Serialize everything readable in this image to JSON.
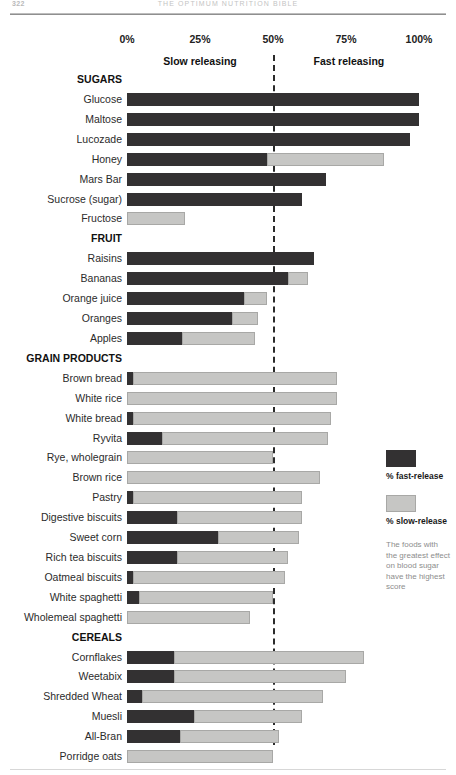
{
  "runhead": {
    "folio": "322",
    "title": "THE OPTIMUM NUTRITION BIBLE"
  },
  "axis": {
    "ticks": [
      "0%",
      "25%",
      "50%",
      "75%",
      "100%"
    ]
  },
  "bands": {
    "slow": "Slow releasing",
    "fast": "Fast releasing"
  },
  "legend": {
    "fast_label": "% fast-release",
    "slow_label": "% slow-release",
    "note": "The foods with the greatest effect on blood sugar have the highest score"
  },
  "colors": {
    "fast_release": "#333132",
    "slow_release": "#c6c6c4",
    "midline": "#2b2b2b",
    "text": "#2b2b2b"
  },
  "chart_data": {
    "type": "bar",
    "orientation": "horizontal",
    "stacked": true,
    "title": "",
    "xlabel": "",
    "ylabel": "",
    "xlim": [
      0,
      100
    ],
    "xticks": [
      0,
      25,
      50,
      75,
      100
    ],
    "grid": false,
    "reference_line": 50,
    "legend_position": "right",
    "series": [
      {
        "name": "% fast-release",
        "color": "#333132"
      },
      {
        "name": "% slow-release",
        "color": "#c6c6c4"
      }
    ],
    "groups": [
      {
        "name": "SUGARS",
        "items": [
          {
            "label": "Glucose",
            "fast": 100,
            "slow": 0,
            "total": 100
          },
          {
            "label": "Maltose",
            "fast": 100,
            "slow": 0,
            "total": 100
          },
          {
            "label": "Lucozade",
            "fast": 97,
            "slow": 0,
            "total": 97
          },
          {
            "label": "Honey",
            "fast": 48,
            "slow": 40,
            "total": 88
          },
          {
            "label": "Mars Bar",
            "fast": 68,
            "slow": 0,
            "total": 68
          },
          {
            "label": "Sucrose (sugar)",
            "fast": 60,
            "slow": 0,
            "total": 60
          },
          {
            "label": "Fructose",
            "fast": 0,
            "slow": 20,
            "total": 20
          }
        ]
      },
      {
        "name": "FRUIT",
        "items": [
          {
            "label": "Raisins",
            "fast": 64,
            "slow": 0,
            "total": 64
          },
          {
            "label": "Bananas",
            "fast": 55,
            "slow": 7,
            "total": 62
          },
          {
            "label": "Orange juice",
            "fast": 40,
            "slow": 8,
            "total": 48
          },
          {
            "label": "Oranges",
            "fast": 36,
            "slow": 9,
            "total": 45
          },
          {
            "label": "Apples",
            "fast": 19,
            "slow": 25,
            "total": 44
          }
        ]
      },
      {
        "name": "GRAIN PRODUCTS",
        "items": [
          {
            "label": "Brown bread",
            "fast": 2,
            "slow": 70,
            "total": 72
          },
          {
            "label": "White rice",
            "fast": 0,
            "slow": 72,
            "total": 72
          },
          {
            "label": "White bread",
            "fast": 2,
            "slow": 68,
            "total": 70
          },
          {
            "label": "Ryvita",
            "fast": 12,
            "slow": 57,
            "total": 69
          },
          {
            "label": "Rye, wholegrain",
            "fast": 0,
            "slow": 50,
            "total": 50
          },
          {
            "label": "Brown rice",
            "fast": 0,
            "slow": 66,
            "total": 66
          },
          {
            "label": "Pastry",
            "fast": 2,
            "slow": 58,
            "total": 60
          },
          {
            "label": "Digestive biscuits",
            "fast": 17,
            "slow": 43,
            "total": 60
          },
          {
            "label": "Sweet corn",
            "fast": 31,
            "slow": 28,
            "total": 59
          },
          {
            "label": "Rich tea biscuits",
            "fast": 17,
            "slow": 38,
            "total": 55
          },
          {
            "label": "Oatmeal biscuits",
            "fast": 2,
            "slow": 52,
            "total": 54
          },
          {
            "label": "White spaghetti",
            "fast": 4,
            "slow": 46,
            "total": 50
          },
          {
            "label": "Wholemeal spaghetti",
            "fast": 0,
            "slow": 42,
            "total": 42
          }
        ]
      },
      {
        "name": "CEREALS",
        "items": [
          {
            "label": "Shredded Wheat",
            "fast": 5,
            "slow": 62,
            "total": 67
          },
          {
            "label": "Cornflakes",
            "fast": 16,
            "slow": 65,
            "total": 81
          },
          {
            "label": "Weetabix",
            "fast": 16,
            "slow": 59,
            "total": 75
          },
          {
            "label": "Muesli",
            "fast": 23,
            "slow": 37,
            "total": 60
          },
          {
            "label": "All-Bran",
            "fast": 18,
            "slow": 34,
            "total": 52
          },
          {
            "label": "Porridge oats",
            "fast": 0,
            "slow": 50,
            "total": 50
          }
        ]
      }
    ],
    "rows": [
      {
        "kind": "group",
        "label": "SUGARS"
      },
      {
        "kind": "bar",
        "label": "Glucose",
        "fast": 100,
        "slow": 0
      },
      {
        "kind": "bar",
        "label": "Maltose",
        "fast": 100,
        "slow": 0
      },
      {
        "kind": "bar",
        "label": "Lucozade",
        "fast": 97,
        "slow": 0
      },
      {
        "kind": "bar",
        "label": "Honey",
        "fast": 48,
        "slow": 40
      },
      {
        "kind": "bar",
        "label": "Mars Bar",
        "fast": 68,
        "slow": 0
      },
      {
        "kind": "bar",
        "label": "Sucrose (sugar)",
        "fast": 60,
        "slow": 0
      },
      {
        "kind": "bar",
        "label": "Fructose",
        "fast": 0,
        "slow": 20
      },
      {
        "kind": "group",
        "label": "FRUIT"
      },
      {
        "kind": "bar",
        "label": "Raisins",
        "fast": 64,
        "slow": 0
      },
      {
        "kind": "bar",
        "label": "Bananas",
        "fast": 55,
        "slow": 7
      },
      {
        "kind": "bar",
        "label": "Orange juice",
        "fast": 40,
        "slow": 8
      },
      {
        "kind": "bar",
        "label": "Oranges",
        "fast": 36,
        "slow": 9
      },
      {
        "kind": "bar",
        "label": "Apples",
        "fast": 19,
        "slow": 25
      },
      {
        "kind": "group",
        "label": "GRAIN PRODUCTS"
      },
      {
        "kind": "bar",
        "label": "Brown bread",
        "fast": 2,
        "slow": 70
      },
      {
        "kind": "bar",
        "label": "White rice",
        "fast": 0,
        "slow": 72
      },
      {
        "kind": "bar",
        "label": "White bread",
        "fast": 2,
        "slow": 68
      },
      {
        "kind": "bar",
        "label": "Ryvita",
        "fast": 12,
        "slow": 57
      },
      {
        "kind": "bar",
        "label": "Rye, wholegrain",
        "fast": 0,
        "slow": 50
      },
      {
        "kind": "bar",
        "label": "Brown rice",
        "fast": 0,
        "slow": 66
      },
      {
        "kind": "bar",
        "label": "Pastry",
        "fast": 2,
        "slow": 58
      },
      {
        "kind": "bar",
        "label": "Digestive biscuits",
        "fast": 17,
        "slow": 43
      },
      {
        "kind": "bar",
        "label": "Sweet corn",
        "fast": 31,
        "slow": 28
      },
      {
        "kind": "bar",
        "label": "Rich tea biscuits",
        "fast": 17,
        "slow": 38
      },
      {
        "kind": "bar",
        "label": "Oatmeal biscuits",
        "fast": 2,
        "slow": 52
      },
      {
        "kind": "bar",
        "label": "White spaghetti",
        "fast": 4,
        "slow": 46
      },
      {
        "kind": "bar",
        "label": "Wholemeal spaghetti",
        "fast": 0,
        "slow": 42
      },
      {
        "kind": "group",
        "label": "CEREALS"
      },
      {
        "kind": "bar",
        "label": "Cornflakes",
        "fast": 16,
        "slow": 65
      },
      {
        "kind": "bar",
        "label": "Weetabix",
        "fast": 16,
        "slow": 59
      },
      {
        "kind": "bar",
        "label": "Shredded Wheat",
        "fast": 5,
        "slow": 62
      },
      {
        "kind": "bar",
        "label": "Muesli",
        "fast": 23,
        "slow": 37
      },
      {
        "kind": "bar",
        "label": "All-Bran",
        "fast": 18,
        "slow": 34
      },
      {
        "kind": "bar",
        "label": "Porridge oats",
        "fast": 0,
        "slow": 50
      }
    ]
  }
}
